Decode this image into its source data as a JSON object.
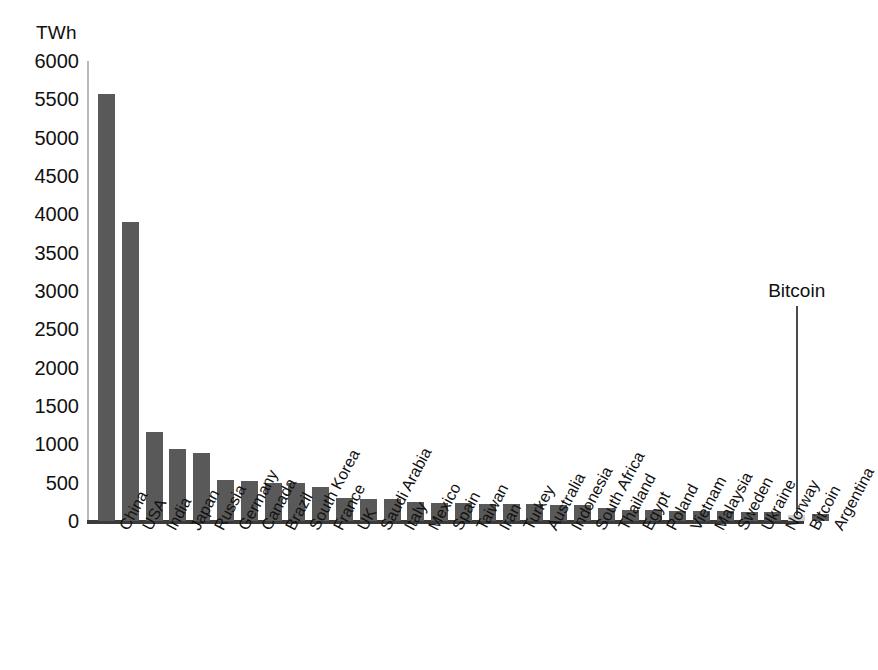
{
  "chart_data": {
    "type": "bar",
    "title": "",
    "subtitle": "",
    "xlabel": "",
    "ylabel": "TWh",
    "unit_label": "TWh",
    "ylim": [
      0,
      6000
    ],
    "ytick_step": 500,
    "yticks": [
      6000,
      5500,
      5000,
      4500,
      4000,
      3500,
      3000,
      2500,
      2000,
      1500,
      1000,
      500,
      0
    ],
    "grid": false,
    "legend": null,
    "categories": [
      "China",
      "USA",
      "India",
      "Japan",
      "Russia",
      "Germany",
      "Canada",
      "Brazil",
      "South Korea",
      "France",
      "UK",
      "Saudi Arabia",
      "Italy",
      "Mexico",
      "Spain",
      "Taiwan",
      "Iran",
      "Turkey",
      "Australia",
      "Indonesia",
      "South Africa",
      "Thailand",
      "Egypt",
      "Poland",
      "Vietnam",
      "Malaysia",
      "Sweden",
      "Ukraine",
      "Norway",
      "Bitcoin",
      "Argentina"
    ],
    "values": [
      5564,
      3902,
      1158,
      934,
      890,
      537,
      516,
      499,
      495,
      446,
      301,
      289,
      286,
      253,
      240,
      231,
      226,
      221,
      216,
      211,
      206,
      172,
      147,
      141,
      136,
      131,
      126,
      123,
      117,
      77,
      88
    ],
    "highlight_index": 29,
    "annotations": [
      {
        "text": "Bitcoin",
        "target_category": "Bitcoin",
        "target_value": 77,
        "label_value": 2800
      }
    ],
    "colors": {
      "bar": "#595959",
      "highlight_bar": "#cfcfcf",
      "axis": "#3b3b3b",
      "text": "#111111"
    }
  }
}
